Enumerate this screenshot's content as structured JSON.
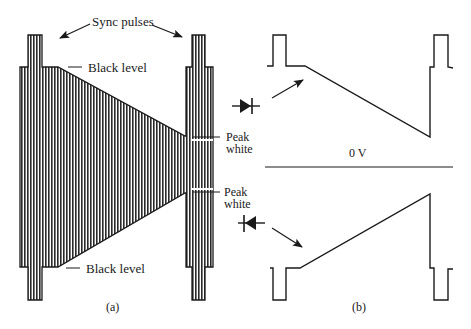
{
  "figure": {
    "panels": [
      {
        "id": "a",
        "caption": "(a)",
        "labels": {
          "sync_pulses": "Sync pulses",
          "black_level_top": "Black level",
          "black_level_bottom": "Black level",
          "peak_white_top": "Peak\nwhite",
          "peak_white_bottom": "Peak\nwhite"
        },
        "peak_white_top_line1": "Peak",
        "peak_white_top_line2": "white",
        "peak_white_bottom_line1": "Peak",
        "peak_white_bottom_line2": "white"
      },
      {
        "id": "b",
        "caption": "(b)",
        "labels": {
          "zero_volt": "0 V"
        }
      }
    ],
    "components": [
      {
        "name": "diode-forward",
        "orientation": "right"
      },
      {
        "name": "diode-reverse",
        "orientation": "left"
      }
    ],
    "colors": {
      "ink": "#1a1a1a",
      "background": "#ffffff"
    }
  }
}
